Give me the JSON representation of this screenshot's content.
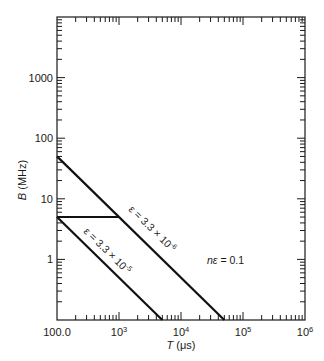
{
  "chart_data": {
    "type": "line",
    "title": "",
    "xlabel": "T (μs)",
    "ylabel": "B (MHz)",
    "xscale": "log",
    "yscale": "log",
    "xlim": [
      100,
      1000000
    ],
    "ylim": [
      0.1,
      10000
    ],
    "grid": false,
    "x_tick_labels": [
      {
        "value": 100,
        "label": "100.0"
      },
      {
        "value": 1000,
        "label": "10",
        "sup": "3"
      },
      {
        "value": 10000,
        "label": "10",
        "sup": "4"
      },
      {
        "value": 100000,
        "label": "10",
        "sup": "5"
      },
      {
        "value": 1000000,
        "label": "10",
        "sup": "6"
      }
    ],
    "y_tick_labels": [
      {
        "value": 1,
        "label": "1"
      },
      {
        "value": 10,
        "label": "10"
      },
      {
        "value": 100,
        "label": "100"
      },
      {
        "value": 1000,
        "label": "1000"
      }
    ],
    "series": [
      {
        "name": "ε = 3.3 × 10⁻⁶",
        "label_text": "ε = 3.3 × 10",
        "label_exp": "-6",
        "points": [
          [
            100,
            50
          ],
          [
            50000,
            0.1
          ]
        ]
      },
      {
        "name": "ε = 3.3 × 10⁻⁵",
        "label_text": "ε = 3.3 × 10",
        "label_exp": "-5",
        "points": [
          [
            100,
            5
          ],
          [
            5000,
            0.1
          ]
        ]
      },
      {
        "name": "connector",
        "label_text": "",
        "points": [
          [
            100,
            5
          ],
          [
            1000,
            5
          ]
        ]
      }
    ],
    "annotations": [
      {
        "text": "nε = 0.1",
        "x": 20000,
        "y": 1.1
      }
    ]
  },
  "labels": {
    "xlabel_italic": "T",
    "xlabel_unit": " (μs)",
    "ylabel_italic": "B",
    "ylabel_unit": " (MHz)",
    "annotation_main": "nε",
    "annotation_value": " = 0.1"
  }
}
